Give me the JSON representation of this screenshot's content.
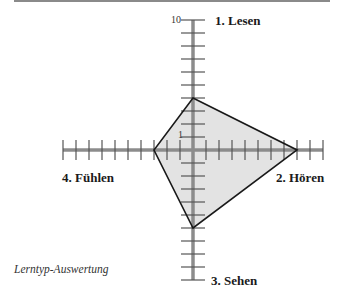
{
  "chart_data": {
    "type": "radar",
    "title": "",
    "caption": "Lerntyp-Auswertung",
    "axes": [
      {
        "name": "1. Lesen",
        "direction": "up",
        "value": 4
      },
      {
        "name": "2. Hören",
        "direction": "right",
        "value": 8
      },
      {
        "name": "3. Sehen",
        "direction": "down",
        "value": 6
      },
      {
        "name": "4. Fühlen",
        "direction": "left",
        "value": 3
      }
    ],
    "range": [
      0,
      10
    ],
    "tick_step": 1,
    "tick_labels": [
      "1",
      "10"
    ],
    "fill_color": "#e3e3e3",
    "stroke_color": "#1a1a1a",
    "axis_color": "#8c8c8c"
  },
  "labels": {
    "lesen": "1. Lesen",
    "hoeren": "2. Hören",
    "sehen": "3. Sehen",
    "fuehlen": "4. Fühlen",
    "tick_max": "10",
    "tick_one": "1",
    "caption": "Lerntyp-Auswertung"
  }
}
